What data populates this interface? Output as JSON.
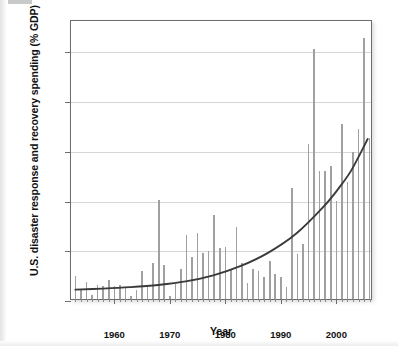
{
  "chart_data": {
    "type": "bar",
    "title": "",
    "xlabel": "Year",
    "ylabel": "U.S. disaster response and recovery spending (% GDP)",
    "xlim": [
      1952.2,
      2006.6
    ],
    "ylim": [
      0,
      0.2815
    ],
    "grid": true,
    "legend": null,
    "y_tick_values": [
      0,
      0.05,
      0.1,
      0.15,
      0.2,
      0.25
    ],
    "y_tick_labels": [
      "0.00%",
      ".05%",
      "0.10%",
      "0.15%",
      "0.20%",
      "0.25%"
    ],
    "x_tick_values": [
      1960,
      1970,
      1980,
      1990,
      2000
    ],
    "x_tick_labels": [
      "1960",
      "1970",
      "1980",
      "1990",
      "2000"
    ],
    "x_minor_tick_interval": 1,
    "bar_color": "#a0a0a0",
    "trend_color": "#3a3a3a",
    "axis_color": "#6d6d6d",
    "grid_color": "#d6d6d6",
    "series": [
      {
        "name": "U.S. disaster response and recovery spending (% GDP)",
        "x": [
          1953,
          1954,
          1955,
          1956,
          1957,
          1958,
          1959,
          1960,
          1961,
          1962,
          1963,
          1964,
          1965,
          1966,
          1967,
          1968,
          1969,
          1970,
          1971,
          1972,
          1973,
          1974,
          1975,
          1976,
          1977,
          1978,
          1979,
          1980,
          1981,
          1982,
          1983,
          1984,
          1985,
          1986,
          1987,
          1988,
          1989,
          1990,
          1991,
          1992,
          1993,
          1994,
          1995,
          1996,
          1997,
          1998,
          1999,
          2000,
          2001,
          2002,
          2003,
          2004,
          2005,
          2006
        ],
        "values": [
          0.023,
          0.01,
          0.017,
          0.004,
          0.014,
          0.013,
          0.019,
          0.013,
          0.014,
          0.012,
          0.003,
          0.009,
          0.028,
          0.012,
          0.036,
          0.1,
          0.034,
          0.003,
          0.015,
          0.03,
          0.064,
          0.042,
          0.066,
          0.046,
          0.048,
          0.084,
          0.051,
          0.052,
          0.03,
          0.072,
          0.036,
          0.016,
          0.03,
          0.028,
          0.022,
          0.038,
          0.025,
          0.022,
          0.012,
          0.112,
          0.045,
          0.055,
          0.156,
          0.251,
          0.129,
          0.129,
          0.134,
          0.099,
          0.176,
          0.118,
          0.148,
          0.171,
          0.262,
          0.162
        ]
      }
    ],
    "trendline": {
      "type": "exponential-fit",
      "x": [
        1953,
        1958,
        1963,
        1968,
        1973,
        1978,
        1983,
        1988,
        1993,
        1998,
        2001,
        2003,
        2005,
        2006
      ],
      "values": [
        0.0095,
        0.0105,
        0.012,
        0.0142,
        0.0178,
        0.024,
        0.0335,
        0.047,
        0.066,
        0.0935,
        0.114,
        0.13,
        0.151,
        0.162
      ]
    },
    "annotations": []
  }
}
